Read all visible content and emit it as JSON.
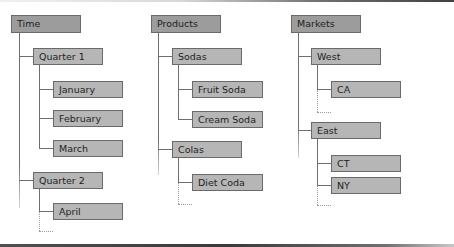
{
  "diagram": {
    "type": "hierarchy-tree",
    "colors": {
      "root_fill": "#9c9c9c",
      "child_fill": "#b6b6b6",
      "border": "#6a6a6a",
      "connector": "#6e6e6e"
    },
    "trees": [
      {
        "label": "Time",
        "children": [
          {
            "label": "Quarter 1",
            "children": [
              {
                "label": "January"
              },
              {
                "label": "February"
              },
              {
                "label": "March"
              }
            ]
          },
          {
            "label": "Quarter 2",
            "children": [
              {
                "label": "April"
              }
            ]
          }
        ]
      },
      {
        "label": "Products",
        "children": [
          {
            "label": "Sodas",
            "children": [
              {
                "label": "Fruit Soda"
              },
              {
                "label": "Cream Soda"
              }
            ]
          },
          {
            "label": "Colas",
            "children": [
              {
                "label": "Diet Coda"
              }
            ]
          }
        ]
      },
      {
        "label": "Markets",
        "children": [
          {
            "label": "West",
            "children": [
              {
                "label": "CA"
              }
            ]
          },
          {
            "label": "East",
            "children": [
              {
                "label": "CT"
              },
              {
                "label": "NY"
              }
            ]
          }
        ]
      }
    ]
  }
}
